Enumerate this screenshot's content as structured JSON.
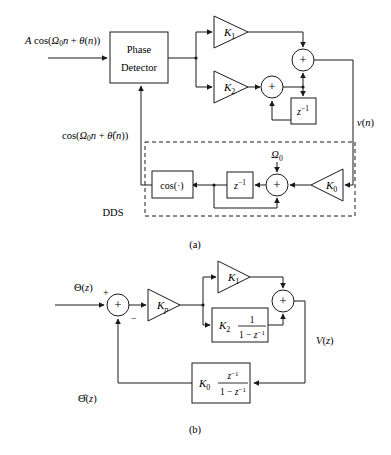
{
  "figure": {
    "caption_a": "(a)",
    "caption_b": "(b)",
    "dds_label": "DDS"
  },
  "diagram_a": {
    "input_signal": "A cos(Ω0n + θ(n))",
    "input_signal_parts": {
      "amp": "A",
      "fn": "cos(",
      "omega": "Ω",
      "omega_sub": "0",
      "n_var": "n",
      "plus": " + ",
      "theta": "θ",
      "arg": "(n))"
    },
    "phase_detector_line1": "Phase",
    "phase_detector_line2": "Detector",
    "gain_k1": "K",
    "gain_k1_sub": "1",
    "gain_k2": "K",
    "gain_k2_sub": "2",
    "gain_k0": "K",
    "gain_k0_sub": "0",
    "delay_label": "z",
    "delay_exp": "−1",
    "summer_symbol": "+",
    "omega0_label": "Ω",
    "omega0_sub": "0",
    "cos_block": "cos(·)",
    "output_label": "v(n)",
    "feedback_label": "cos(Ω0n + θ̂(n))"
  },
  "diagram_b": {
    "input_label": "Θ(z)",
    "plus_sign": "+",
    "minus_sign": "−",
    "gain_kp": "K",
    "gain_kp_sub": "p",
    "gain_k1": "K",
    "gain_k1_sub": "1",
    "gain_k2": "K",
    "gain_k2_sub": "2",
    "gain_k0": "K",
    "gain_k0_sub": "0",
    "k2_numerator": "1",
    "k2_denominator": "1 − z⁻¹",
    "k0_numerator": "z⁻¹",
    "k0_denominator": "1 − z⁻¹",
    "summer_symbol": "+",
    "output_label": "V(z)",
    "feedback_label": "Θ̂(z)"
  },
  "colors": {
    "stroke": "#1a1a1a",
    "background": "#ffffff"
  }
}
